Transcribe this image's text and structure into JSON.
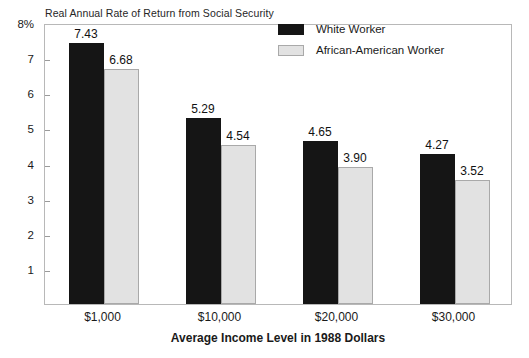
{
  "chart_data": {
    "type": "bar",
    "title": "Real Annual Rate of Return from Social Security",
    "xlabel": "Average Income Level in 1988 Dollars",
    "ylabel": "",
    "categories": [
      "$1,000",
      "$10,000",
      "$20,000",
      "$30,000"
    ],
    "series": [
      {
        "name": "White Worker",
        "color": "#151515",
        "values": [
          7.43,
          5.29,
          4.65,
          4.27
        ]
      },
      {
        "name": "African-American Worker",
        "color": "#e2e2e2",
        "values": [
          6.68,
          4.54,
          3.9,
          3.52
        ]
      }
    ],
    "value_labels": [
      [
        "7.43",
        "6.68"
      ],
      [
        "5.29",
        "4.54"
      ],
      [
        "4.65",
        "3.90"
      ],
      [
        "4.27",
        "3.52"
      ]
    ],
    "ylim": [
      0,
      8
    ],
    "y_ticks": [
      8,
      7,
      6,
      5,
      4,
      3,
      2,
      1
    ],
    "y_tick_labels": [
      "8%",
      "7",
      "6",
      "5",
      "4",
      "3",
      "2",
      "1"
    ],
    "grid": false,
    "legend_position": "top-right"
  },
  "legend": {
    "items": [
      {
        "label": "White Worker"
      },
      {
        "label": "African-American Worker"
      }
    ]
  },
  "artifact": {
    "bottom_edge_text": ""
  }
}
